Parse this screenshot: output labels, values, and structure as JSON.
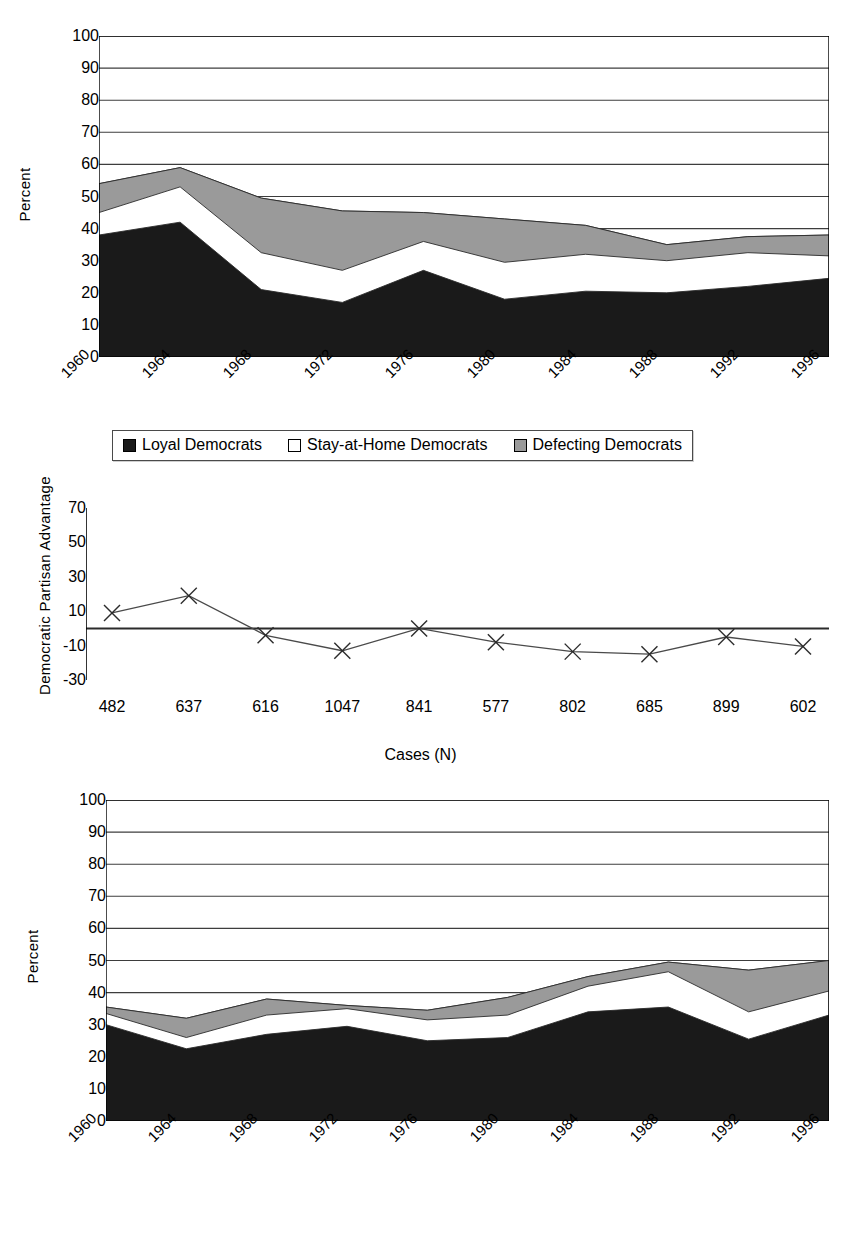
{
  "colors": {
    "loyal": "#1a1a1a",
    "stay_at_home": "#ffffff",
    "defecting": "#9a9a9a",
    "axis": "#000000",
    "grid": "#333333",
    "line": "#4a4a4a"
  },
  "chart_data": [
    {
      "id": "democrats",
      "type": "area",
      "stacked": true,
      "title": "",
      "xlabel": "",
      "ylabel": "Percent",
      "ylim": [
        0,
        100
      ],
      "yticks": [
        0,
        10,
        20,
        30,
        40,
        50,
        60,
        70,
        80,
        90,
        100
      ],
      "grid": true,
      "legend_position": "bottom",
      "categories": [
        "1960",
        "1964",
        "1968",
        "1972",
        "1976",
        "1980",
        "1984",
        "1988",
        "1992",
        "1996"
      ],
      "series": [
        {
          "name": "Loyal Democrats",
          "values": [
            38,
            42,
            21,
            17,
            27,
            18,
            20.5,
            20,
            22,
            24.5
          ]
        },
        {
          "name": "Stay-at-Home Democrats",
          "values": [
            7,
            11,
            11.5,
            10,
            9,
            11.5,
            11.5,
            10,
            10.5,
            7
          ]
        },
        {
          "name": "Defecting Democrats",
          "values": [
            9,
            6,
            17,
            18.5,
            9,
            13.5,
            9,
            5,
            5,
            6.5
          ]
        }
      ],
      "cumulative": [
        [
          38,
          42,
          21,
          17,
          27,
          18,
          20.5,
          20,
          22,
          24.5
        ],
        [
          45,
          53,
          32.5,
          27,
          36,
          29.5,
          32,
          30,
          32.5,
          31.5
        ],
        [
          54,
          59,
          49.5,
          45.5,
          45,
          43,
          41,
          35,
          37.5,
          38
        ]
      ]
    },
    {
      "id": "partisan-advantage",
      "type": "line",
      "title": "",
      "xlabel": "Cases (N)",
      "ylabel": "Democratic Partisan Advantage",
      "ylim": [
        -30,
        70
      ],
      "yticks": [
        -30,
        -10,
        10,
        30,
        50,
        70
      ],
      "grid": false,
      "zero_line": true,
      "marker": "x",
      "categories": [
        "482",
        "637",
        "616",
        "1047",
        "841",
        "577",
        "802",
        "685",
        "899",
        "602"
      ],
      "values": [
        9,
        19,
        -4,
        -13,
        0,
        -8,
        -13.5,
        -15,
        -5,
        -10.5
      ]
    },
    {
      "id": "republicans",
      "type": "area",
      "stacked": true,
      "title": "",
      "xlabel": "",
      "ylabel": "Percent",
      "ylim": [
        0,
        100
      ],
      "yticks": [
        0,
        10,
        20,
        30,
        40,
        50,
        60,
        70,
        80,
        90,
        100
      ],
      "grid": true,
      "legend_position": "bottom",
      "categories": [
        "1960",
        "1964",
        "1968",
        "1972",
        "1976",
        "1980",
        "1984",
        "1988",
        "1992",
        "1996"
      ],
      "series": [
        {
          "name": "Loyal Republicans",
          "values": [
            30,
            22.5,
            27,
            29.5,
            25,
            26,
            34,
            35.5,
            25.5,
            33
          ]
        },
        {
          "name": "Stay-at-Home Republicans",
          "values": [
            3.5,
            3.5,
            6,
            5.5,
            6.5,
            7,
            8,
            11,
            8.5,
            7.5
          ]
        },
        {
          "name": "Defecting Republicans",
          "values": [
            2,
            6,
            5,
            1.5,
            3,
            5.5,
            3,
            3,
            13,
            9.5
          ]
        }
      ],
      "cumulative": [
        [
          30,
          22.5,
          27,
          29.5,
          25,
          26,
          34,
          35.5,
          25.5,
          33
        ],
        [
          33.5,
          26,
          33,
          35,
          31.5,
          33,
          42,
          46.5,
          34,
          40.5
        ],
        [
          35.5,
          32,
          38,
          36,
          34.5,
          38.5,
          45,
          49.5,
          47,
          50
        ]
      ]
    }
  ],
  "chart1": {
    "ylabel": "Percent",
    "yticks": [
      "100",
      "90",
      "80",
      "70",
      "60",
      "50",
      "40",
      "30",
      "20",
      "10",
      "0"
    ],
    "xticks": [
      "1960",
      "1964",
      "1968",
      "1972",
      "1976",
      "1980",
      "1984",
      "1988",
      "1992",
      "1996"
    ],
    "legend": [
      {
        "label": "Loyal Democrats",
        "swatch": "dark"
      },
      {
        "label": "Stay-at-Home Democrats",
        "swatch": "white"
      },
      {
        "label": "Defecting Democrats",
        "swatch": "gray"
      }
    ]
  },
  "chart2": {
    "ylabel": "Democratic Partisan Advantage",
    "yticks": [
      "70",
      "50",
      "30",
      "10",
      "-10",
      "-30"
    ],
    "xticks": [
      "482",
      "637",
      "616",
      "1047",
      "841",
      "577",
      "802",
      "685",
      "899",
      "602"
    ],
    "xaxis_caption": "Cases (N)"
  },
  "chart3": {
    "ylabel": "Percent",
    "yticks": [
      "100",
      "90",
      "80",
      "70",
      "60",
      "50",
      "40",
      "30",
      "20",
      "10",
      "0"
    ],
    "xticks": [
      "1960",
      "1964",
      "1968",
      "1972",
      "1976",
      "1980",
      "1984",
      "1988",
      "1992",
      "1996"
    ],
    "legend": [
      {
        "label": "Loyal Republicans",
        "swatch": "dark"
      },
      {
        "label": "Stay-at-Home Republicans",
        "swatch": "white"
      },
      {
        "label": "Defecting Republicans",
        "swatch": "gray"
      }
    ]
  }
}
